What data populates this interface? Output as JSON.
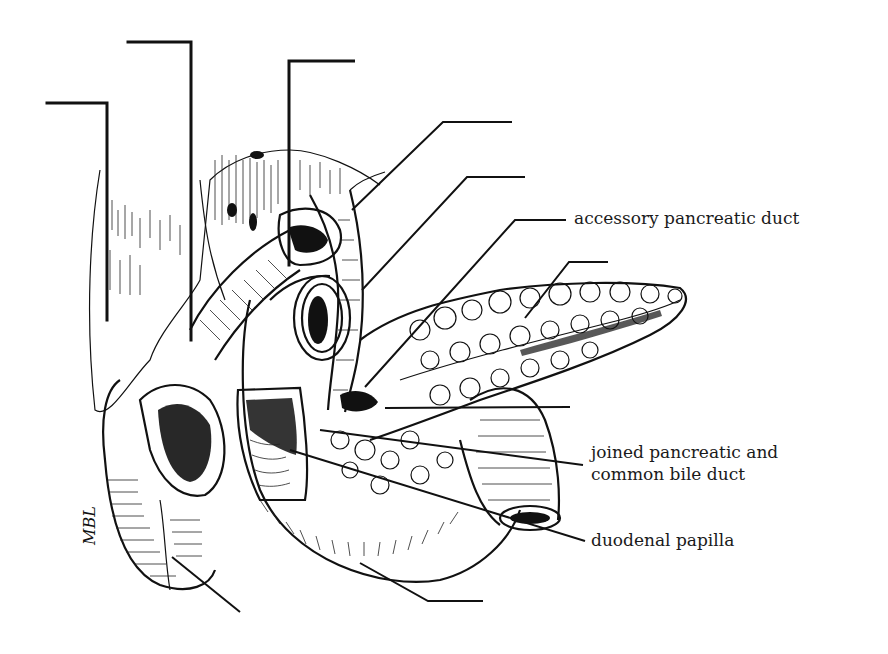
{
  "figure": {
    "type": "anatomical-illustration",
    "signature": "MBL",
    "colors": {
      "ink": "#111111",
      "background": "#ffffff"
    }
  },
  "labels": [
    {
      "id": "accessory-pancreatic-duct",
      "text": "accessory pancreatic duct"
    },
    {
      "id": "joined-duct-line1",
      "text": "joined pancreatic and"
    },
    {
      "id": "joined-duct-line2",
      "text": "common bile duct"
    },
    {
      "id": "duodenal-papilla",
      "text": "duodenal papilla"
    }
  ],
  "unlabeled_leaders": 8
}
